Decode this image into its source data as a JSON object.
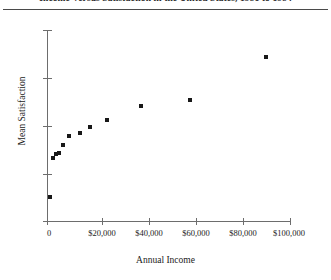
{
  "chart_data": {
    "type": "scatter",
    "title": "Income Versus Satisfaction in the United States, 1981 to 1984",
    "xlabel": "Annual Income",
    "ylabel": "Mean Satisfaction",
    "xlim": [
      0,
      100000
    ],
    "ylim": [
      0,
      1
    ],
    "grid": false,
    "legend": null,
    "xticks": [
      0,
      20000,
      40000,
      60000,
      80000,
      100000
    ],
    "xticklabels": [
      "0",
      "$20,000",
      "$40,000",
      "$60,000",
      "$80,000",
      "$100,000"
    ],
    "yticks": [
      0.0,
      0.25,
      0.5,
      0.75,
      1.0
    ],
    "yticklabels": [
      "",
      "",
      "",
      "",
      ""
    ],
    "marker": "square",
    "marker_color": "#181818",
    "points": [
      {
        "x": 1200,
        "y": 0.125
      },
      {
        "x": 2600,
        "y": 0.33
      },
      {
        "x": 3700,
        "y": 0.35
      },
      {
        "x": 5000,
        "y": 0.355
      },
      {
        "x": 6400,
        "y": 0.4
      },
      {
        "x": 9000,
        "y": 0.445
      },
      {
        "x": 13500,
        "y": 0.46
      },
      {
        "x": 17500,
        "y": 0.49
      },
      {
        "x": 24500,
        "y": 0.53
      },
      {
        "x": 38500,
        "y": 0.6
      },
      {
        "x": 59000,
        "y": 0.635
      },
      {
        "x": 90000,
        "y": 0.86
      }
    ]
  },
  "figure": {
    "title": "Income Versus Satisfaction in the United States, 1981 to 1984",
    "xlabel": "Annual Income",
    "ylabel": "Mean Satisfaction",
    "xticklabels": [
      "0",
      "$20,000",
      "$40,000",
      "$60,000",
      "$80,000",
      "$100,000"
    ]
  }
}
